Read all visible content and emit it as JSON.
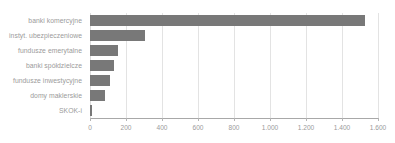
{
  "chart_data": {
    "type": "bar",
    "orientation": "horizontal",
    "title": "",
    "subtitle": "",
    "xlabel": "",
    "ylabel": "",
    "grid": true,
    "legend": false,
    "legend_position": "none",
    "xlim": [
      0,
      1600
    ],
    "categories": [
      "banki komercyjne",
      "instyt. ubezpieczeniowe",
      "fundusze emerytalne",
      "banki spółdzielcze",
      "fundusze inwestycyjne",
      "domy maklerskie",
      "SKOK-i"
    ],
    "values": [
      1528,
      305,
      155,
      133,
      111,
      83,
      10
    ],
    "tick_values": [
      0,
      200,
      400,
      600,
      800,
      1000,
      1200,
      1400,
      1600
    ],
    "tick_labels": [
      "0",
      "200",
      "400",
      "600",
      "800",
      "1.000",
      "1.200",
      "1.400",
      "1.600"
    ],
    "bar_color": "#787878",
    "gridline_color": "#e3e3e3",
    "axis_color": "#a8a8a8",
    "label_color": "#9b9b9b",
    "background_color": "#ffffff"
  }
}
